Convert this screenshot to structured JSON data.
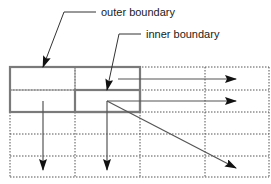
{
  "diagram": {
    "labels": {
      "outer": "outer boundary",
      "inner": "inner boundary"
    },
    "grid": {
      "columns": 4,
      "rows": 4,
      "style": "dotted"
    },
    "boxes": [
      {
        "name": "outer-boundary",
        "color": "#808080"
      },
      {
        "name": "inner-boundary",
        "color": "#808080"
      }
    ],
    "arrows": [
      {
        "name": "horizontal-arrow-row1",
        "direction": "right"
      },
      {
        "name": "horizontal-arrow-row2",
        "direction": "right"
      },
      {
        "name": "diagonal-arrow",
        "direction": "down-right"
      },
      {
        "name": "vertical-arrow-col1",
        "direction": "down"
      },
      {
        "name": "vertical-arrow-col2",
        "direction": "down"
      }
    ],
    "colors": {
      "grid": "#555555",
      "boundary": "#7a7a7a",
      "arrow": "#333333",
      "arrowhead": "#111111"
    }
  }
}
